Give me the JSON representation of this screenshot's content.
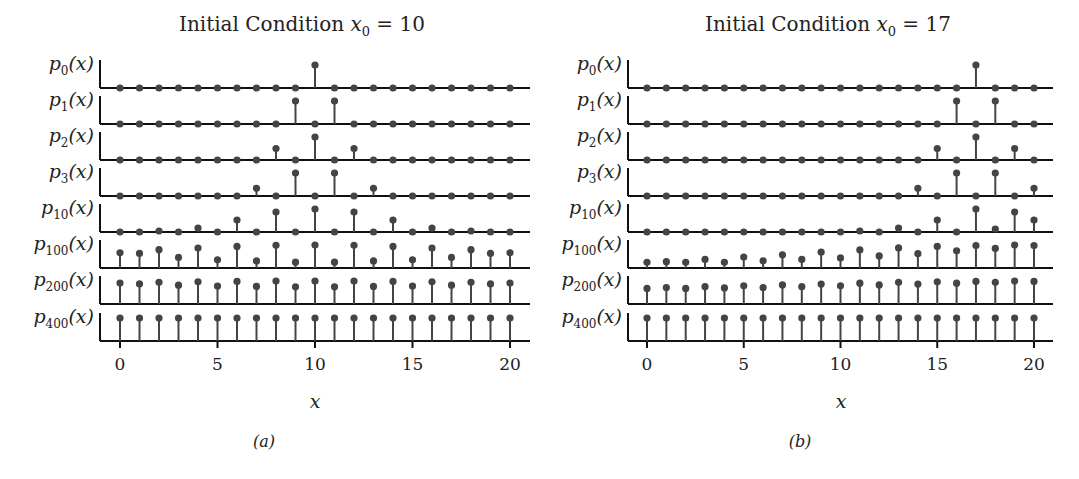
{
  "figure": {
    "panels": [
      {
        "id": "a",
        "title_prefix": "Initial Condition ",
        "title_var": "x",
        "title_sub": "0",
        "title_suffix": " = 10",
        "caption": "(a)",
        "xlabel": "x",
        "xticks": [
          "0",
          "5",
          "10",
          "15",
          "20"
        ]
      },
      {
        "id": "b",
        "title_prefix": "Initial Condition ",
        "title_var": "x",
        "title_sub": "0",
        "title_suffix": " = 17",
        "caption": "(b)",
        "xlabel": "x",
        "xticks": [
          "0",
          "5",
          "10",
          "15",
          "20"
        ]
      }
    ],
    "row_labels": [
      {
        "base": "p",
        "sub": "0",
        "arg": "(x)"
      },
      {
        "base": "p",
        "sub": "1",
        "arg": "(x)"
      },
      {
        "base": "p",
        "sub": "2",
        "arg": "(x)"
      },
      {
        "base": "p",
        "sub": "3",
        "arg": "(x)"
      },
      {
        "base": "p",
        "sub": "10",
        "arg": "(x)"
      },
      {
        "base": "p",
        "sub": "100",
        "arg": "(x)"
      },
      {
        "base": "p",
        "sub": "200",
        "arg": "(x)"
      },
      {
        "base": "p",
        "sub": "400",
        "arg": "(x)"
      }
    ],
    "colors": {
      "stem": "#444444",
      "marker": "#444444",
      "axis": "#111111"
    }
  },
  "chart_data": [
    {
      "type": "stem",
      "title": "Initial Condition x0 = 10",
      "xlabel": "x",
      "ylabel": "",
      "caption": "(a)",
      "x": [
        0,
        1,
        2,
        3,
        4,
        5,
        6,
        7,
        8,
        9,
        10,
        11,
        12,
        13,
        14,
        15,
        16,
        17,
        18,
        19,
        20
      ],
      "xlim": [
        -1,
        21
      ],
      "xticks": [
        0,
        5,
        10,
        15,
        20
      ],
      "series": [
        {
          "name": "p0(x)",
          "values": [
            0,
            0,
            0,
            0,
            0,
            0,
            0,
            0,
            0,
            0,
            1,
            0,
            0,
            0,
            0,
            0,
            0,
            0,
            0,
            0,
            0
          ]
        },
        {
          "name": "p1(x)",
          "values": [
            0,
            0,
            0,
            0,
            0,
            0,
            0,
            0,
            0,
            0.5,
            0,
            0.5,
            0,
            0,
            0,
            0,
            0,
            0,
            0,
            0,
            0
          ]
        },
        {
          "name": "p2(x)",
          "values": [
            0,
            0,
            0,
            0,
            0,
            0,
            0,
            0,
            0.25,
            0,
            0.5,
            0,
            0.25,
            0,
            0,
            0,
            0,
            0,
            0,
            0,
            0
          ]
        },
        {
          "name": "p3(x)",
          "values": [
            0,
            0,
            0,
            0,
            0,
            0,
            0,
            0.125,
            0,
            0.375,
            0,
            0.375,
            0,
            0.125,
            0,
            0,
            0,
            0,
            0,
            0,
            0
          ]
        },
        {
          "name": "p10(x)",
          "values": [
            0,
            0,
            0.01,
            0,
            0.04,
            0,
            0.12,
            0,
            0.2,
            0,
            0.23,
            0,
            0.2,
            0,
            0.12,
            0,
            0.04,
            0,
            0.01,
            0,
            0
          ]
        },
        {
          "name": "p100(x)",
          "values": [
            0.065,
            0.062,
            0.078,
            0.045,
            0.085,
            0.035,
            0.092,
            0.03,
            0.097,
            0.025,
            0.098,
            0.025,
            0.097,
            0.03,
            0.092,
            0.035,
            0.085,
            0.045,
            0.078,
            0.062,
            0.065
          ]
        },
        {
          "name": "p200(x)",
          "values": [
            0.05,
            0.048,
            0.052,
            0.045,
            0.053,
            0.043,
            0.054,
            0.042,
            0.055,
            0.041,
            0.055,
            0.041,
            0.055,
            0.042,
            0.054,
            0.043,
            0.053,
            0.045,
            0.052,
            0.048,
            0.05
          ]
        },
        {
          "name": "p400(x)",
          "values": [
            0.048,
            0.048,
            0.048,
            0.048,
            0.048,
            0.048,
            0.048,
            0.048,
            0.048,
            0.048,
            0.048,
            0.048,
            0.048,
            0.048,
            0.048,
            0.048,
            0.048,
            0.048,
            0.048,
            0.048,
            0.048
          ]
        }
      ]
    },
    {
      "type": "stem",
      "title": "Initial Condition x0 = 17",
      "xlabel": "x",
      "ylabel": "",
      "caption": "(b)",
      "x": [
        0,
        1,
        2,
        3,
        4,
        5,
        6,
        7,
        8,
        9,
        10,
        11,
        12,
        13,
        14,
        15,
        16,
        17,
        18,
        19,
        20
      ],
      "xlim": [
        -1,
        21
      ],
      "xticks": [
        0,
        5,
        10,
        15,
        20
      ],
      "series": [
        {
          "name": "p0(x)",
          "values": [
            0,
            0,
            0,
            0,
            0,
            0,
            0,
            0,
            0,
            0,
            0,
            0,
            0,
            0,
            0,
            0,
            0,
            1,
            0,
            0,
            0
          ]
        },
        {
          "name": "p1(x)",
          "values": [
            0,
            0,
            0,
            0,
            0,
            0,
            0,
            0,
            0,
            0,
            0,
            0,
            0,
            0,
            0,
            0,
            0.5,
            0,
            0.5,
            0,
            0
          ]
        },
        {
          "name": "p2(x)",
          "values": [
            0,
            0,
            0,
            0,
            0,
            0,
            0,
            0,
            0,
            0,
            0,
            0,
            0,
            0,
            0,
            0.25,
            0,
            0.5,
            0,
            0.25,
            0
          ]
        },
        {
          "name": "p3(x)",
          "values": [
            0,
            0,
            0,
            0,
            0,
            0,
            0,
            0,
            0,
            0,
            0,
            0,
            0,
            0,
            0.125,
            0,
            0.375,
            0,
            0.375,
            0,
            0.125
          ]
        },
        {
          "name": "p10(x)",
          "values": [
            0,
            0,
            0,
            0,
            0,
            0,
            0,
            0,
            0,
            0,
            0,
            0.01,
            0,
            0.04,
            0,
            0.12,
            0,
            0.23,
            0.03,
            0.2,
            0.12
          ]
        },
        {
          "name": "p100(x)",
          "values": [
            0.02,
            0.022,
            0.02,
            0.03,
            0.02,
            0.038,
            0.025,
            0.046,
            0.03,
            0.055,
            0.035,
            0.063,
            0.042,
            0.07,
            0.05,
            0.075,
            0.06,
            0.078,
            0.068,
            0.08,
            0.078
          ]
        },
        {
          "name": "p200(x)",
          "values": [
            0.036,
            0.038,
            0.036,
            0.04,
            0.037,
            0.042,
            0.038,
            0.044,
            0.04,
            0.046,
            0.042,
            0.048,
            0.044,
            0.05,
            0.046,
            0.051,
            0.048,
            0.052,
            0.05,
            0.053,
            0.052
          ]
        },
        {
          "name": "p400(x)",
          "values": [
            0.048,
            0.048,
            0.048,
            0.048,
            0.048,
            0.048,
            0.048,
            0.048,
            0.048,
            0.048,
            0.048,
            0.048,
            0.048,
            0.048,
            0.048,
            0.048,
            0.048,
            0.048,
            0.048,
            0.048,
            0.048
          ]
        }
      ]
    }
  ]
}
